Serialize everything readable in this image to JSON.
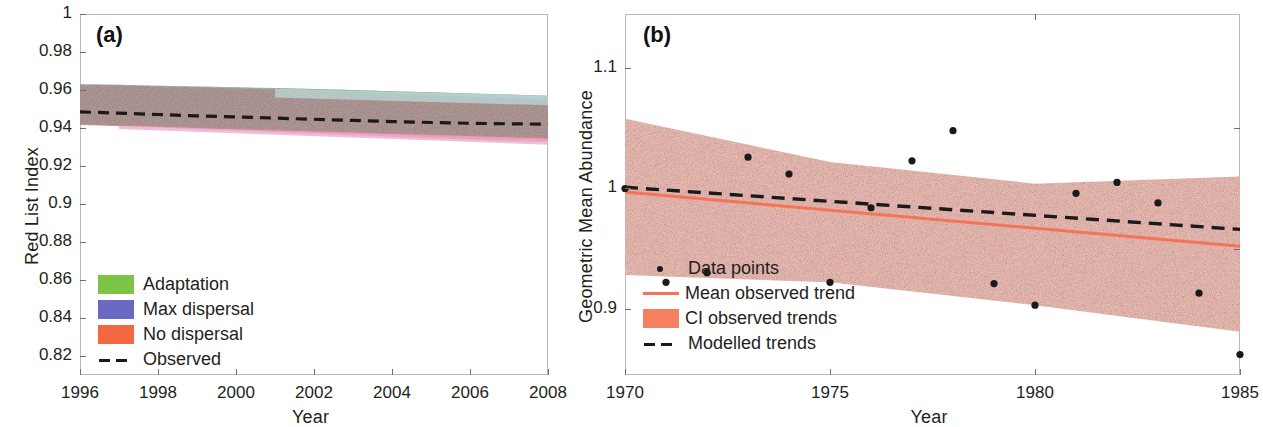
{
  "figure": {
    "panels": [
      "a",
      "b"
    ]
  },
  "panel_a": {
    "tag": "(a)",
    "xlabel": "Year",
    "ylabel": "Red List Index",
    "xticks": [
      "1996",
      "1998",
      "2000",
      "2002",
      "2004",
      "2006",
      "2008"
    ],
    "yticks": [
      "1",
      "0.98",
      "0.96",
      "0.94",
      "0.92",
      "0.9",
      "0.88",
      "0.86",
      "0.84",
      "0.82"
    ],
    "legend": [
      {
        "label": "Adaptation",
        "color": "#7cc446",
        "key": "swatch"
      },
      {
        "label": "Max dispersal",
        "color": "#6a6ac4",
        "key": "swatch"
      },
      {
        "label": "No dispersal",
        "color": "#f2683f",
        "key": "swatch"
      },
      {
        "label": "Observed",
        "color": "#1a1a1a",
        "key": "dashed-line"
      }
    ]
  },
  "panel_b": {
    "tag": "(b)",
    "xlabel": "Year",
    "ylabel": "Geometric Mean Abundance",
    "xticks": [
      "1970",
      "1975",
      "1980",
      "1985"
    ],
    "yticks": [
      "1.1",
      "1",
      "0.9"
    ],
    "legend": [
      {
        "label": "Data points",
        "color": "#1a1a1a",
        "key": "dot"
      },
      {
        "label": "Mean observed trend",
        "color": "#f4745a",
        "key": "solid-line"
      },
      {
        "label": "CI observed trends",
        "color": "#f5805f",
        "key": "swatch"
      },
      {
        "label": "Modelled trends",
        "color": "#1a1a1a",
        "key": "dashed-line"
      }
    ]
  },
  "chart_data": [
    {
      "type": "area",
      "panel": "a",
      "title": "",
      "xlabel": "Year",
      "ylabel": "Red List Index",
      "xlim": [
        1996,
        2008
      ],
      "ylim": [
        0.81,
        1.0
      ],
      "xticks": [
        1996,
        1998,
        2000,
        2002,
        2004,
        2006,
        2008
      ],
      "yticks": [
        0.82,
        0.84,
        0.86,
        0.88,
        0.9,
        0.92,
        0.94,
        0.96,
        0.98,
        1
      ],
      "grid": false,
      "legend_position": "lower-left",
      "x": [
        1996,
        1997,
        1998,
        1999,
        2000,
        2001,
        2002,
        2003,
        2004,
        2005,
        2006,
        2007,
        2008
      ],
      "series": [
        {
          "name": "Observed",
          "style": "dashed",
          "color": "#1a1a1a",
          "values": [
            0.9485,
            0.9478,
            0.9471,
            0.9464,
            0.9458,
            0.9452,
            0.9446,
            0.944,
            0.9434,
            0.9429,
            0.9425,
            0.9422,
            0.942
          ]
        },
        {
          "name": "Adaptation",
          "style": "band",
          "color": "#7cc446",
          "upper": [
            0.963,
            0.9627,
            0.9623,
            0.9619,
            0.9614,
            0.961,
            0.9605,
            0.96,
            0.9594,
            0.9588,
            0.9582,
            0.9576,
            0.957
          ],
          "lower": [
            0.942,
            0.9415,
            0.941,
            0.9404,
            0.9398,
            0.9392,
            0.9386,
            0.938,
            0.9374,
            0.9368,
            0.9362,
            0.9357,
            0.9352
          ]
        },
        {
          "name": "Max dispersal",
          "style": "band",
          "color": "#6a6ac4",
          "upper": [
            0.9628,
            0.9624,
            0.9619,
            0.9614,
            0.9608,
            0.9602,
            0.9596,
            0.9589,
            0.9582,
            0.9574,
            0.9566,
            0.9558,
            0.955
          ],
          "lower": [
            0.9418,
            0.9412,
            0.9406,
            0.9399,
            0.9392,
            0.9385,
            0.9378,
            0.9371,
            0.9364,
            0.9357,
            0.935,
            0.9344,
            0.9338
          ]
        },
        {
          "name": "No dispersal",
          "style": "band",
          "color": "#f2683f",
          "upper": [
            0.9626,
            0.9621,
            0.9615,
            0.9609,
            0.9602,
            0.9595,
            0.9588,
            0.958,
            0.9572,
            0.9563,
            0.9554,
            0.9545,
            0.9536
          ],
          "lower": [
            0.9416,
            0.9409,
            0.9402,
            0.9394,
            0.9386,
            0.9378,
            0.937,
            0.9362,
            0.9354,
            0.9346,
            0.9339,
            0.9332,
            0.9326
          ]
        }
      ]
    },
    {
      "type": "scatter",
      "panel": "b",
      "title": "",
      "xlabel": "Year",
      "ylabel": "Geometric Mean Abundance",
      "xlim": [
        1970,
        1985
      ],
      "ylim": [
        0.845,
        1.145
      ],
      "xticks": [
        1970,
        1975,
        1980,
        1985
      ],
      "yticks": [
        0.9,
        1,
        1.1
      ],
      "grid": false,
      "legend_position": "lower-left",
      "points": [
        {
          "x": 1970,
          "y": 1.0
        },
        {
          "x": 1971,
          "y": 0.922
        },
        {
          "x": 1972,
          "y": 0.93
        },
        {
          "x": 1973,
          "y": 1.026
        },
        {
          "x": 1974,
          "y": 1.012
        },
        {
          "x": 1975,
          "y": 0.922
        },
        {
          "x": 1976,
          "y": 0.984
        },
        {
          "x": 1977,
          "y": 1.023
        },
        {
          "x": 1978,
          "y": 1.048
        },
        {
          "x": 1979,
          "y": 0.921
        },
        {
          "x": 1980,
          "y": 0.903
        },
        {
          "x": 1981,
          "y": 0.996
        },
        {
          "x": 1982,
          "y": 1.005
        },
        {
          "x": 1983,
          "y": 0.988
        },
        {
          "x": 1984,
          "y": 0.913
        },
        {
          "x": 1985,
          "y": 0.862
        }
      ],
      "series": [
        {
          "name": "Mean observed trend",
          "style": "solid",
          "color": "#f4745a",
          "x": [
            1970,
            1985
          ],
          "values": [
            0.997,
            0.952
          ]
        },
        {
          "name": "Modelled trends",
          "style": "dashed",
          "color": "#1a1a1a",
          "x": [
            1970,
            1985
          ],
          "values": [
            1.001,
            0.966
          ]
        },
        {
          "name": "CI observed trends",
          "style": "band",
          "color": "#f9c4bb",
          "x": [
            1970,
            1975,
            1980,
            1985
          ],
          "upper": [
            1.058,
            1.022,
            1.004,
            1.01
          ],
          "lower": [
            0.928,
            0.922,
            0.903,
            0.881
          ]
        }
      ]
    }
  ]
}
